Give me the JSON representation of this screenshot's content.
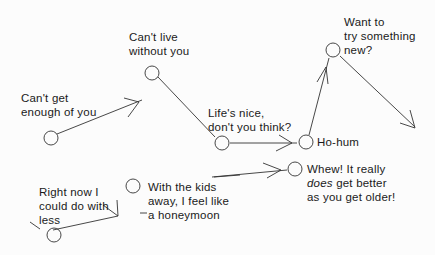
{
  "diagram": {
    "type": "timeline-path",
    "stages": [
      {
        "id": "s1",
        "lines": [
          "Can't get",
          "enough of you"
        ]
      },
      {
        "id": "s2",
        "lines": [
          "Can't live",
          "without you"
        ]
      },
      {
        "id": "s3",
        "lines": [
          "Life's nice,",
          "don't you think?"
        ]
      },
      {
        "id": "s4",
        "lines": [
          "Ho-hum"
        ]
      },
      {
        "id": "s5",
        "lines": [
          "Want to",
          "try something",
          "new?"
        ]
      },
      {
        "id": "s6",
        "lines": [
          "Right now I",
          "could do with",
          "less"
        ]
      },
      {
        "id": "s7",
        "lines": [
          "With the kids",
          "away, I feel like",
          "a honeymoon"
        ]
      },
      {
        "id": "s8",
        "lines": [
          "Whew! It really",
          "does get better",
          "as you get older!"
        ],
        "emphasis": "does"
      }
    ],
    "stroke_color": "#333333"
  }
}
